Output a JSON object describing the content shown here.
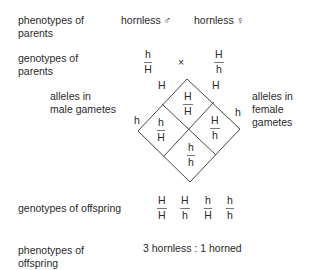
{
  "parents": {
    "phenotypes_label": "phenotypes of parents",
    "male_phenotype": "hornless ♂",
    "female_phenotype": "hornless ♀",
    "genotypes_label": "genotypes of parents",
    "male_genotype": {
      "top": "h",
      "bottom": "H"
    },
    "cross_symbol": "×",
    "female_genotype": {
      "top": "H",
      "bottom": "h"
    }
  },
  "gametes": {
    "male_label_line1": "alleles in",
    "male_label_line2": "male gametes",
    "female_label_line1": "alleles in",
    "female_label_line2": "female",
    "female_label_line3": "gametes",
    "male_alleles": [
      "H",
      "h"
    ],
    "female_alleles": [
      "H",
      "h"
    ]
  },
  "punnett": {
    "top": {
      "top": "H",
      "bottom": "H"
    },
    "left": {
      "top": "h",
      "bottom": "H"
    },
    "right": {
      "top": "H",
      "bottom": "h"
    },
    "bottom": {
      "top": "h",
      "bottom": "h"
    }
  },
  "offspring": {
    "genotypes_label": "genotypes of offspring",
    "genotypes": [
      {
        "top": "H",
        "bottom": "H"
      },
      {
        "top": "H",
        "bottom": "h"
      },
      {
        "top": "h",
        "bottom": "H"
      },
      {
        "top": "h",
        "bottom": "h"
      }
    ],
    "phenotypes_label_line1": "phenotypes of",
    "phenotypes_label_line2": "offspring",
    "ratio": "3 hornless : 1 horned"
  }
}
